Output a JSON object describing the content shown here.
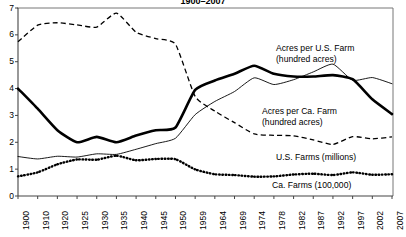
{
  "chart_data": {
    "type": "line",
    "title": "1900–2007",
    "xlabel": "",
    "ylabel": "",
    "ylim": [
      0,
      7
    ],
    "yticks": [
      0,
      1,
      2,
      3,
      4,
      5,
      6,
      7
    ],
    "grid": false,
    "legend_position": "inline-annotations",
    "categories": [
      "1900",
      "1910",
      "1920",
      "1925",
      "1930",
      "1935",
      "1940",
      "1945",
      "1950",
      "1959",
      "1964",
      "1969",
      "1974",
      "1978",
      "1982",
      "1987",
      "1992",
      "1997",
      "2002",
      "2007"
    ],
    "series": [
      {
        "name": "Acres per Ca. Farm (hundred acres)",
        "style": "thick-solid",
        "color": "#000000",
        "values": [
          4.0,
          3.25,
          2.45,
          2.0,
          2.2,
          2.0,
          2.25,
          2.45,
          2.55,
          3.95,
          4.3,
          4.55,
          4.85,
          4.55,
          4.45,
          4.45,
          4.5,
          4.35,
          3.6,
          3.05
        ]
      },
      {
        "name": "Acres per U.S. Farm (hundred acres)",
        "style": "thin-solid",
        "color": "#000000",
        "values": [
          1.47,
          1.38,
          1.48,
          1.45,
          1.57,
          1.55,
          1.74,
          1.95,
          2.15,
          3.03,
          3.52,
          3.89,
          4.4,
          4.15,
          4.33,
          4.62,
          4.91,
          4.31,
          4.41,
          4.18
        ]
      },
      {
        "name": "U.S. Farms (millions)",
        "style": "dashed",
        "color": "#000000",
        "values": [
          5.74,
          6.36,
          6.45,
          6.37,
          6.29,
          6.81,
          6.1,
          5.86,
          5.65,
          3.71,
          3.16,
          2.73,
          2.31,
          2.26,
          2.24,
          2.09,
          1.92,
          2.21,
          2.13,
          2.2
        ]
      },
      {
        "name": "Ca. Farms (100,000)",
        "style": "dotted",
        "color": "#000000",
        "values": [
          0.73,
          0.88,
          1.18,
          1.36,
          1.35,
          1.5,
          1.33,
          1.38,
          1.37,
          0.99,
          0.81,
          0.78,
          0.72,
          0.73,
          0.8,
          0.83,
          0.78,
          0.88,
          0.79,
          0.81
        ]
      }
    ],
    "annotations": [
      {
        "id": "acres-per-us-farm",
        "lines": [
          "Acres per U.S. Farm",
          "(hundred acres)"
        ]
      },
      {
        "id": "acres-per-ca-farm",
        "lines": [
          "Acres per Ca. Farm",
          "(hundred acres)"
        ]
      },
      {
        "id": "us-farms",
        "lines": [
          "U.S. Farms (millions)"
        ]
      },
      {
        "id": "ca-farms",
        "lines": [
          "Ca. Farms (100,000)"
        ]
      }
    ]
  }
}
